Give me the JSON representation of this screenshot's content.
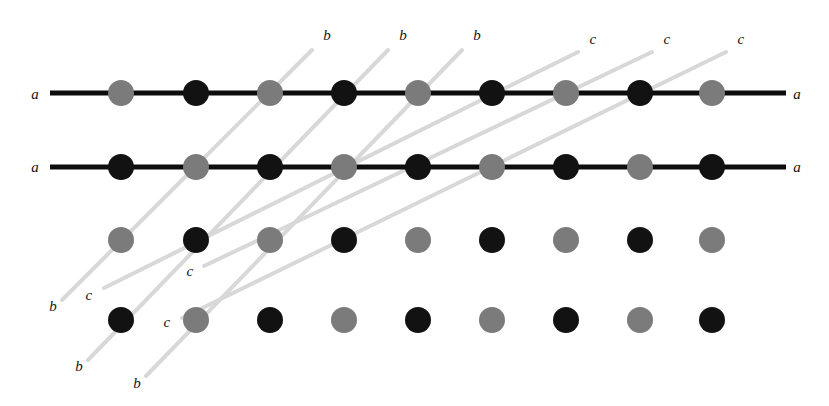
{
  "figure": {
    "width": 829,
    "height": 406,
    "background_color": "#ffffff"
  },
  "colors": {
    "atom_gray": "#7b7b7b",
    "atom_black": "#121212",
    "plane_a_line": "#0d0d0d",
    "plane_bc_line": "#d8d8d8",
    "label_text": "#141414"
  },
  "geometry": {
    "atom_radius": 13,
    "column_x": [
      121,
      196,
      270,
      344,
      418,
      492,
      566,
      640,
      712
    ],
    "row_y": [
      93,
      167,
      240,
      320
    ],
    "a_line_start_x": 50,
    "a_line_end_x": 786,
    "a_line_width": 5,
    "bc_line_width": 4
  },
  "atoms": {
    "rows": [
      {
        "row_index": 0,
        "y": 93,
        "pattern": [
          "gray",
          "black",
          "gray",
          "black",
          "gray",
          "black",
          "gray",
          "black",
          "gray"
        ]
      },
      {
        "row_index": 1,
        "y": 167,
        "pattern": [
          "black",
          "gray",
          "black",
          "gray",
          "black",
          "gray",
          "black",
          "gray",
          "black"
        ]
      },
      {
        "row_index": 2,
        "y": 240,
        "pattern": [
          "gray",
          "black",
          "gray",
          "black",
          "gray",
          "black",
          "gray",
          "black",
          "gray"
        ]
      },
      {
        "row_index": 3,
        "y": 320,
        "pattern": [
          "black",
          "gray",
          "black",
          "gray",
          "black",
          "gray",
          "black",
          "gray",
          "black"
        ]
      }
    ]
  },
  "planes": {
    "a": [
      {
        "id": "a-plane-top",
        "label": "a",
        "x1": 50,
        "y1": 93,
        "x2": 786,
        "y2": 93,
        "label_left": {
          "text": "a",
          "x": 35,
          "y": 94
        },
        "label_right": {
          "text": "a",
          "x": 797,
          "y": 94
        }
      },
      {
        "id": "a-plane-bottom",
        "label": "a",
        "x1": 50,
        "y1": 167,
        "x2": 786,
        "y2": 167,
        "label_left": {
          "text": "a",
          "x": 35,
          "y": 167
        },
        "label_right": {
          "text": "a",
          "x": 797,
          "y": 167
        }
      }
    ],
    "b": [
      {
        "id": "b-plane-1",
        "label": "b",
        "x1": 62,
        "y1": 300,
        "x2": 312,
        "y2": 50,
        "label_start": {
          "text": "b",
          "x": 53,
          "y": 306
        },
        "label_end": {
          "text": "b",
          "x": 327,
          "y": 35
        }
      },
      {
        "id": "b-plane-2",
        "label": "b",
        "x1": 88,
        "y1": 360,
        "x2": 388,
        "y2": 50,
        "label_start": {
          "text": "b",
          "x": 79,
          "y": 366
        },
        "label_end": {
          "text": "b",
          "x": 403,
          "y": 35
        }
      },
      {
        "id": "b-plane-3",
        "label": "b",
        "x1": 146,
        "y1": 376,
        "x2": 462,
        "y2": 50,
        "label_start": {
          "text": "b",
          "x": 137,
          "y": 383
        },
        "label_end": {
          "text": "b",
          "x": 477,
          "y": 35
        }
      }
    ],
    "c": [
      {
        "id": "c-plane-1",
        "label": "c",
        "x1": 104,
        "y1": 288,
        "x2": 578,
        "y2": 52,
        "label_start": {
          "text": "c",
          "x": 89,
          "y": 295
        },
        "label_end": {
          "text": "c",
          "x": 593,
          "y": 39
        }
      },
      {
        "id": "c-plane-2",
        "label": "c",
        "x1": 204,
        "y1": 266,
        "x2": 652,
        "y2": 52,
        "label_start": {
          "text": "c",
          "x": 190,
          "y": 271
        },
        "label_end": {
          "text": "c",
          "x": 667,
          "y": 39
        }
      },
      {
        "id": "c-plane-3",
        "label": "c",
        "x1": 182,
        "y1": 318,
        "x2": 726,
        "y2": 52,
        "label_start": {
          "text": "c",
          "x": 167,
          "y": 322
        },
        "label_end": {
          "text": "c",
          "x": 741,
          "y": 39
        }
      }
    ]
  },
  "chart_data": {
    "type": "scatter",
    "xlabel": "",
    "ylabel": "",
    "grid": false,
    "legend_position": "none",
    "annotations": [
      "a",
      "a",
      "a",
      "a",
      "b",
      "b",
      "b",
      "b",
      "b",
      "b",
      "c",
      "c",
      "c",
      "c",
      "c",
      "c"
    ],
    "series": [
      {
        "name": "gray ions",
        "color": "#7b7b7b",
        "points": [
          [
            121,
            93
          ],
          [
            270,
            93
          ],
          [
            418,
            93
          ],
          [
            566,
            93
          ],
          [
            712,
            93
          ],
          [
            196,
            167
          ],
          [
            344,
            167
          ],
          [
            492,
            167
          ],
          [
            640,
            167
          ],
          [
            121,
            240
          ],
          [
            270,
            240
          ],
          [
            418,
            240
          ],
          [
            566,
            240
          ],
          [
            712,
            240
          ],
          [
            196,
            320
          ],
          [
            344,
            320
          ],
          [
            492,
            320
          ],
          [
            640,
            320
          ]
        ]
      },
      {
        "name": "black ions",
        "color": "#121212",
        "points": [
          [
            196,
            93
          ],
          [
            344,
            93
          ],
          [
            492,
            93
          ],
          [
            640,
            93
          ],
          [
            121,
            167
          ],
          [
            270,
            167
          ],
          [
            418,
            167
          ],
          [
            566,
            167
          ],
          [
            712,
            167
          ],
          [
            196,
            240
          ],
          [
            344,
            240
          ],
          [
            492,
            240
          ],
          [
            640,
            240
          ],
          [
            121,
            320
          ],
          [
            270,
            320
          ],
          [
            418,
            320
          ],
          [
            566,
            320
          ],
          [
            712,
            320
          ]
        ]
      }
    ]
  }
}
